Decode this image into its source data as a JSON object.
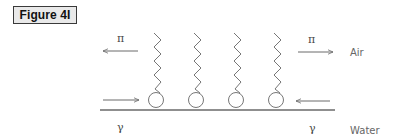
{
  "figure": {
    "label": "Figure 4I"
  },
  "diagram": {
    "phases": {
      "top": "Air",
      "bottom": "Water"
    },
    "symbols": {
      "surface_pressure": "π",
      "surface_tension": "γ"
    },
    "molecule_count": 4,
    "arrows": [
      {
        "position": "top-left",
        "direction": "left",
        "symbol": "π"
      },
      {
        "position": "top-right",
        "direction": "right",
        "symbol": "π"
      },
      {
        "position": "bottom-left",
        "direction": "right",
        "symbol": "γ"
      },
      {
        "position": "bottom-right",
        "direction": "left",
        "symbol": "γ"
      }
    ],
    "colors": {
      "line": "#6a6a6a",
      "text": "#555555"
    }
  }
}
